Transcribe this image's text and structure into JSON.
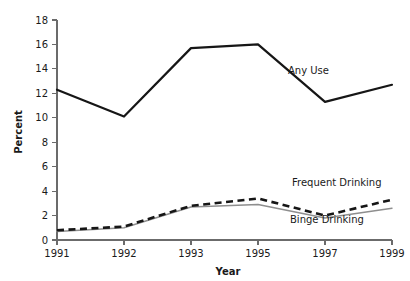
{
  "chart_data": {
    "type": "line",
    "title": "",
    "xlabel": "Year",
    "ylabel": "Percent",
    "categories": [
      "1991",
      "1992",
      "1993",
      "1995",
      "1997",
      "1999"
    ],
    "ylim": [
      0,
      18
    ],
    "ytick_step": 2,
    "yticks": [
      "0",
      "2",
      "4",
      "6",
      "8",
      "10",
      "12",
      "14",
      "16",
      "18"
    ],
    "grid": false,
    "legend": "inline-annotations",
    "series": [
      {
        "name": "Any Use",
        "style": "solid-thick-black",
        "color": "#161616",
        "values": [
          12.3,
          10.1,
          15.7,
          16.0,
          11.3,
          12.7
        ]
      },
      {
        "name": "Frequent Drinking",
        "style": "dashed-thick-black",
        "color": "#161616",
        "values": [
          0.8,
          1.1,
          2.8,
          3.4,
          2.0,
          3.3
        ]
      },
      {
        "name": "Binge Drinking",
        "style": "solid-thin-gray",
        "color": "#8e8e8e",
        "values": [
          0.7,
          1.0,
          2.7,
          2.9,
          1.8,
          2.6
        ]
      }
    ],
    "annotations": [
      {
        "text": "Any Use",
        "x_px": 288,
        "y_px": 74
      },
      {
        "text": "Frequent Drinking",
        "x_px": 292,
        "y_px": 186
      },
      {
        "text": "Binge Drinking",
        "x_px": 290,
        "y_px": 223
      }
    ]
  }
}
